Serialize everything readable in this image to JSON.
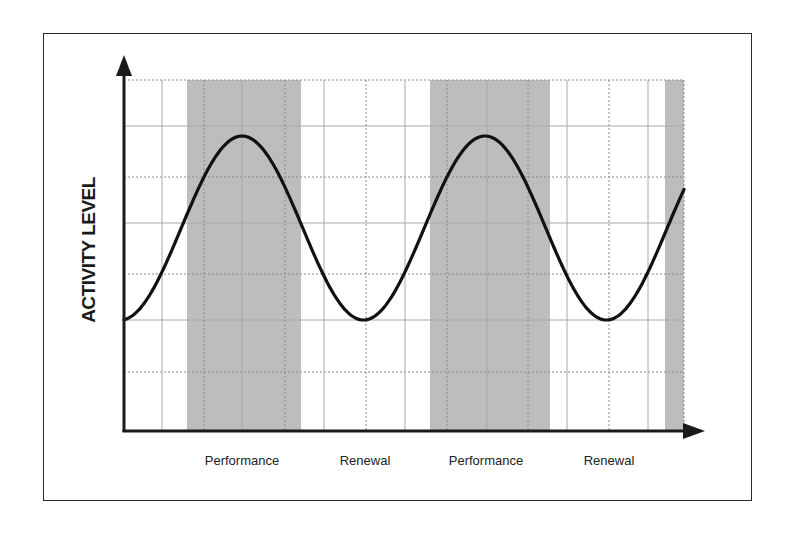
{
  "chart_data": {
    "type": "line",
    "title": "",
    "xlabel": "",
    "ylabel": "ACTIVITY LEVEL",
    "phase_labels": [
      "Performance",
      "Renewal",
      "Performance",
      "Renewal"
    ],
    "shaded_phases": [
      {
        "label": "Performance",
        "x_start_px": 187,
        "x_end_px": 301
      },
      {
        "label": "Performance",
        "x_start_px": 430,
        "x_end_px": 550
      },
      {
        "label": "Performance (partial)",
        "x_start_px": 665,
        "x_end_px": 684
      }
    ],
    "curve": {
      "shape": "sinusoidal oscillation",
      "peaks_at": [
        "Performance",
        "Performance"
      ],
      "troughs_at": [
        "Renewal",
        "Renewal"
      ],
      "cycles_shown": 1.82
    },
    "grid": true,
    "axis_ticks": "none",
    "legend": "none",
    "colors": {
      "curve": "#111111",
      "shade": "#bdbdbd",
      "grid": "#a8a8a8",
      "axis": "#1a1a1a"
    }
  },
  "labels": {
    "ylabel": "ACTIVITY LEVEL",
    "x1": "Performance",
    "x2": "Renewal",
    "x3": "Performance",
    "x4": "Renewal"
  }
}
